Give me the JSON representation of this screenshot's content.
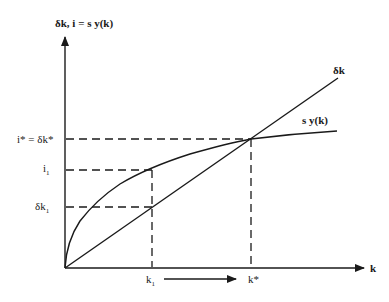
{
  "diagram": {
    "type": "solow-growth-model",
    "y_axis_label": "δk, i = s y(k)",
    "x_axis_label": "k",
    "lines": {
      "depreciation_label": "δk",
      "investment_label": "s y(k)"
    },
    "y_labels": {
      "steady_state": "i* = δk*",
      "i1_base": "i",
      "i1_sub": "1",
      "dk1_base": "δk",
      "dk1_sub": "1"
    },
    "x_labels": {
      "k1_base": "k",
      "k1_sub": "1",
      "kstar": "k*"
    },
    "annotation": "arrow from k1 toward k* indicating capital accumulation",
    "colors": {
      "ink": "#1a1a1a",
      "background": "#ffffff"
    }
  }
}
